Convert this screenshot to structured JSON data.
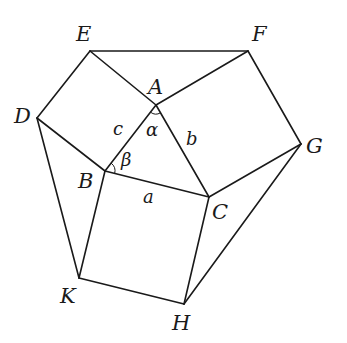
{
  "diagram": {
    "type": "geometry",
    "colors": {
      "stroke": "#1a1a1a",
      "background": "#ffffff"
    },
    "vertices": {
      "A": {
        "x": 156,
        "y": 105,
        "label": "A"
      },
      "B": {
        "x": 105,
        "y": 171,
        "label": "B"
      },
      "C": {
        "x": 209,
        "y": 197,
        "label": "C"
      },
      "D": {
        "x": 37,
        "y": 118,
        "label": "D"
      },
      "E": {
        "x": 90,
        "y": 51,
        "label": "E"
      },
      "F": {
        "x": 248,
        "y": 51,
        "label": "F"
      },
      "G": {
        "x": 301,
        "y": 144,
        "label": "G"
      },
      "H": {
        "x": 184,
        "y": 304,
        "label": "H"
      },
      "K": {
        "x": 79,
        "y": 278,
        "label": "K"
      }
    },
    "side_labels": {
      "a": "a",
      "b": "b",
      "c": "c"
    },
    "angle_labels": {
      "alpha": "α",
      "beta": "β"
    },
    "squares": [
      [
        "A",
        "B",
        "D",
        "E"
      ],
      [
        "A",
        "C",
        "G",
        "F"
      ],
      [
        "B",
        "C",
        "H",
        "K"
      ]
    ],
    "connecting_edges": [
      [
        "E",
        "F"
      ],
      [
        "D",
        "K"
      ],
      [
        "G",
        "H"
      ]
    ]
  }
}
